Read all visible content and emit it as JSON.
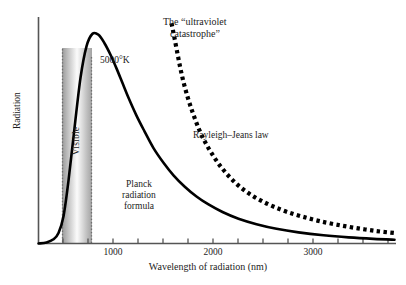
{
  "figure": {
    "background_color": "#ffffff",
    "axis_color": "#4a4a4a",
    "curve_color": "#000000"
  },
  "chart_data": {
    "type": "line",
    "title": "",
    "xlabel": "Wavelength of radiation (nm)",
    "ylabel": "Radiation",
    "xlim": [
      0,
      3575
    ],
    "ylim": [
      0,
      1.08
    ],
    "grid": false,
    "legend_position": "inline-annotations",
    "xticks": [
      1000,
      2000,
      3000
    ],
    "xtick_labels": [
      "1000",
      "2000",
      "3000"
    ],
    "minor_xticks": [
      250,
      500,
      750,
      1000,
      1250,
      1500,
      1750,
      2000,
      2250,
      2500,
      2750,
      3000,
      3250,
      3500
    ],
    "yticks": [],
    "ytick_labels": [],
    "annotations": [
      {
        "name": "temperature",
        "text": "5000°K"
      },
      {
        "name": "uv-catastrophe",
        "line1": "The “ultraviolet",
        "line2": "catastrophe”"
      },
      {
        "name": "rayleigh-jeans",
        "text": "Rayleigh–Jeans law"
      },
      {
        "name": "planck",
        "line1": "Planck",
        "line2": "radiation",
        "line3": "formula"
      },
      {
        "name": "visible-band",
        "text": "Visible"
      }
    ],
    "bands": [
      {
        "name": "visible-band",
        "label": "Visible",
        "x_start": 250,
        "x_end": 770,
        "border_style": "dotted",
        "border_color": "#6e6e6e",
        "fill": "gradient-gray-white-gray"
      }
    ],
    "series": [
      {
        "name": "Planck radiation formula",
        "style": "solid",
        "color": "#000000",
        "width": 2.6,
        "x": [
          0,
          80,
          150,
          200,
          250,
          300,
          360,
          420,
          480,
          540,
          600,
          660,
          720,
          780,
          840,
          900,
          980,
          1060,
          1150,
          1250,
          1350,
          1460,
          1580,
          1700,
          1840,
          2000,
          2180,
          2380,
          2600,
          2850,
          3100,
          3350,
          3560
        ],
        "y": [
          0.0,
          0.005,
          0.02,
          0.05,
          0.13,
          0.3,
          0.55,
          0.79,
          0.94,
          1.0,
          0.995,
          0.955,
          0.9,
          0.835,
          0.765,
          0.695,
          0.61,
          0.535,
          0.455,
          0.385,
          0.325,
          0.272,
          0.224,
          0.186,
          0.15,
          0.118,
          0.092,
          0.07,
          0.053,
          0.039,
          0.029,
          0.022,
          0.018
        ]
      },
      {
        "name": "Rayleigh–Jeans law",
        "style": "dotted",
        "color": "#000000",
        "width": 4.2,
        "x": [
          1330,
          1360,
          1400,
          1440,
          1490,
          1545,
          1605,
          1670,
          1745,
          1825,
          1915,
          2010,
          2115,
          2230,
          2355,
          2490,
          2640,
          2800,
          2980,
          3170,
          3370,
          3560
        ],
        "y": [
          1.05,
          0.98,
          0.88,
          0.79,
          0.7,
          0.62,
          0.545,
          0.48,
          0.42,
          0.365,
          0.315,
          0.272,
          0.235,
          0.203,
          0.175,
          0.15,
          0.128,
          0.108,
          0.09,
          0.074,
          0.06,
          0.05
        ]
      }
    ]
  },
  "axis": {
    "x_label": "Wavelength of radiation (nm)",
    "y_label": "Radiation",
    "tick_labels": [
      "1000",
      "2000",
      "3000"
    ]
  },
  "labels": {
    "temperature": "5000°K",
    "uv_catastrophe_line1": "The “ultraviolet",
    "uv_catastrophe_line2": "catastrophe”",
    "rayleigh_jeans": "Rayleigh–Jeans law",
    "planck_line1": "Planck",
    "planck_line2": "radiation",
    "planck_line3": "formula",
    "visible": "Visible"
  }
}
